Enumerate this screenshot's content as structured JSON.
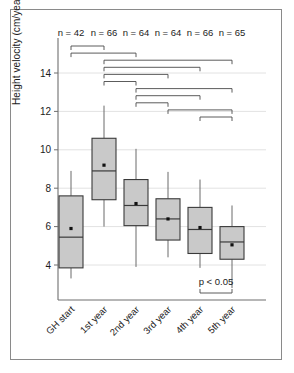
{
  "chart_data": {
    "type": "box",
    "title": "",
    "xlabel": "",
    "ylabel": "Height velocity (cm/year)",
    "ylim": [
      2.4,
      15.6
    ],
    "yticks": [
      4,
      6,
      8,
      10,
      12,
      14
    ],
    "grid": true,
    "categories": [
      "GH start",
      "1st year",
      "2nd year",
      "3rd year",
      "4th year",
      "5th year"
    ],
    "sample_sizes": [
      "n = 42",
      "n = 66",
      "n = 64",
      "n = 64",
      "n = 66",
      "n = 65"
    ],
    "boxes": [
      {
        "category": "GH start",
        "whisker_low": 3.3,
        "q1": 3.85,
        "median": 5.45,
        "mean": 5.9,
        "q3": 7.6,
        "whisker_high": 8.9
      },
      {
        "category": "1st year",
        "whisker_low": 6.0,
        "q1": 7.4,
        "median": 8.9,
        "mean": 9.2,
        "q3": 10.6,
        "whisker_high": 12.3
      },
      {
        "category": "2nd year",
        "whisker_low": 3.9,
        "q1": 6.05,
        "median": 7.1,
        "mean": 7.2,
        "q3": 8.45,
        "whisker_high": 10.05
      },
      {
        "category": "3rd year",
        "whisker_low": 4.4,
        "q1": 5.3,
        "median": 6.4,
        "mean": 6.4,
        "q3": 7.45,
        "whisker_high": 8.85
      },
      {
        "category": "4th year",
        "whisker_low": 3.85,
        "q1": 4.6,
        "median": 5.85,
        "mean": 5.95,
        "q3": 7.0,
        "whisker_high": 8.45
      },
      {
        "category": "5th year",
        "whisker_low": 2.8,
        "q1": 4.3,
        "median": 5.2,
        "mean": 5.05,
        "q3": 6.0,
        "whisker_high": 7.1
      }
    ],
    "significance_label": "p < 0.05",
    "significance_brackets": [
      {
        "from": "GH start",
        "to": "1st year",
        "level": 0
      },
      {
        "from": "GH start",
        "to": "2nd year",
        "level": 1
      },
      {
        "from": "1st year",
        "to": "5th year",
        "level": 2
      },
      {
        "from": "1st year",
        "to": "4th year",
        "level": 3
      },
      {
        "from": "1st year",
        "to": "3rd year",
        "level": 4
      },
      {
        "from": "1st year",
        "to": "2nd year",
        "level": 5
      },
      {
        "from": "2nd year",
        "to": "5th year",
        "level": 6
      },
      {
        "from": "2nd year",
        "to": "4th year",
        "level": 7
      },
      {
        "from": "2nd year",
        "to": "3rd year",
        "level": 8
      },
      {
        "from": "3rd year",
        "to": "5th year",
        "level": 9
      },
      {
        "from": "4th year",
        "to": "5th year",
        "level": 10
      }
    ],
    "colors": {
      "box_fill": "#c9c9c9",
      "box_stroke": "#3a3a3a",
      "grid": "#e2e2e2",
      "axis": "#6f6f6f",
      "text": "#1b1b1b",
      "frame": "#8a8a8a"
    }
  }
}
